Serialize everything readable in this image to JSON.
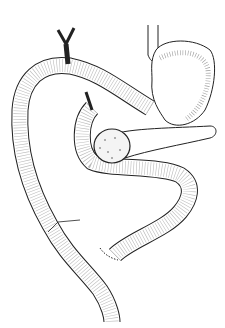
{
  "figure": {
    "kind": "medical line illustration",
    "background": "#ffffff",
    "ink": "#1a1a1a"
  }
}
